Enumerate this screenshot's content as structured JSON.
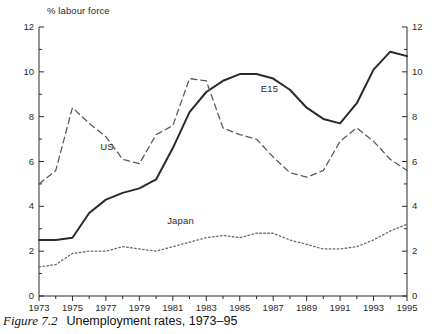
{
  "figure": {
    "caption_number": "Figure 7.2",
    "caption_text": "Unemployment rates, 1973–95"
  },
  "chart_data": {
    "type": "line",
    "title": "Unemployment rates, 1973–95",
    "xlabel": "",
    "ylabel": "% labour force",
    "y_axis_title": "% labour force",
    "xlim": [
      1973,
      1995
    ],
    "ylim": [
      0,
      12
    ],
    "grid": false,
    "legend_position": "inline-labels",
    "y_major_ticks": [
      0,
      2,
      4,
      6,
      8,
      10,
      12
    ],
    "y_minor_ticks": [
      1,
      3,
      5,
      7,
      9,
      11
    ],
    "y_tick_labels": [
      "0",
      "2",
      "4",
      "6",
      "8",
      "10",
      "12"
    ],
    "dual_y_axis": true,
    "x_major_ticks": [
      1973,
      1975,
      1977,
      1979,
      1981,
      1983,
      1985,
      1987,
      1989,
      1991,
      1993,
      1995
    ],
    "x_minor_ticks": [
      1974,
      1976,
      1978,
      1980,
      1982,
      1984,
      1986,
      1988,
      1990,
      1992,
      1994
    ],
    "x_tick_labels": [
      "1973",
      "1975",
      "1977",
      "1979",
      "1981",
      "1983",
      "1985",
      "1987",
      "1989",
      "1991",
      "1993",
      "1995"
    ],
    "x": [
      1973,
      1974,
      1975,
      1976,
      1977,
      1978,
      1979,
      1980,
      1981,
      1982,
      1983,
      1984,
      1985,
      1986,
      1987,
      1988,
      1989,
      1990,
      1991,
      1992,
      1993,
      1994,
      1995
    ],
    "series": [
      {
        "name": "E15",
        "label": "E15",
        "style": "solid",
        "color": "#2a2a2a",
        "values": [
          2.5,
          2.5,
          2.6,
          3.7,
          4.3,
          4.6,
          4.8,
          5.2,
          6.6,
          8.2,
          9.1,
          9.6,
          9.9,
          9.9,
          9.7,
          9.2,
          8.4,
          7.9,
          7.7,
          8.6,
          10.1,
          10.9,
          10.7
        ]
      },
      {
        "name": "US",
        "label": "US",
        "style": "dashed",
        "color": "#5a5a5a",
        "values": [
          5.0,
          5.6,
          8.4,
          7.7,
          7.1,
          6.1,
          5.9,
          7.2,
          7.6,
          9.7,
          9.6,
          7.5,
          7.2,
          7.0,
          6.2,
          5.5,
          5.3,
          5.6,
          6.9,
          7.5,
          6.9,
          6.1,
          5.6
        ]
      },
      {
        "name": "Japan",
        "label": "Japan",
        "style": "dotted",
        "color": "#6a6a6a",
        "values": [
          1.3,
          1.4,
          1.9,
          2.0,
          2.0,
          2.2,
          2.1,
          2.0,
          2.2,
          2.4,
          2.6,
          2.7,
          2.6,
          2.8,
          2.8,
          2.5,
          2.3,
          2.1,
          2.1,
          2.2,
          2.5,
          2.9,
          3.2
        ]
      }
    ],
    "annotations": [
      {
        "text": "US",
        "x": 1977.2,
        "y": 6.6
      },
      {
        "text": "E15",
        "x": 1986.8,
        "y": 9.2
      },
      {
        "text": "Japan",
        "x": 1981.2,
        "y": 3.3
      }
    ]
  }
}
